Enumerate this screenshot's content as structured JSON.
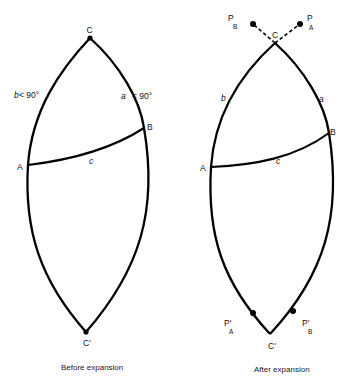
{
  "figure": {
    "panels": [
      {
        "id": "before",
        "caption": "Before expansion",
        "vertices": {
          "C": "C",
          "A": "A",
          "B": "B",
          "C_prime": "C'"
        },
        "sides": {
          "a": "a",
          "a_condition": "< 90°",
          "b": "b",
          "b_condition": "< 90°",
          "c": "c"
        }
      },
      {
        "id": "after",
        "caption": "After expansion",
        "vertices": {
          "C": "C",
          "A": "A",
          "B": "B",
          "C_prime": "C'"
        },
        "poles": {
          "P": "P",
          "PA_sub": "A",
          "PB_sub": "B",
          "P_prime": "P'",
          "PpA_sub": "A",
          "PpB_sub": "B"
        },
        "sides": {
          "a": "a",
          "b": "b",
          "c": "c"
        }
      }
    ],
    "colors": {
      "stroke": "#000000",
      "background": "#ffffff"
    }
  }
}
